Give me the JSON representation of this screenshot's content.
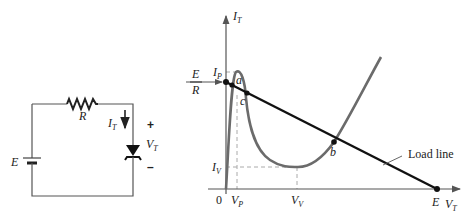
{
  "circuit": {
    "source_label": "E",
    "resistor_label": "R",
    "current_label": "I",
    "current_sub": "T",
    "voltage_label": "V",
    "voltage_sub": "T",
    "plus": "+",
    "minus": "–"
  },
  "graph": {
    "y_axis_label": "I",
    "y_axis_sub": "T",
    "x_axis_label": "V",
    "x_axis_sub": "T",
    "origin": "0",
    "ip_label": "I",
    "ip_sub": "P",
    "iv_label": "I",
    "iv_sub": "V",
    "vp_label": "V",
    "vp_sub": "P",
    "vv_label": "V",
    "vv_sub": "V",
    "e_over_r_num": "E",
    "e_over_r_den": "R",
    "e_label": "E",
    "point_a": "a",
    "point_b": "b",
    "point_c": "c",
    "load_line_label": "Load line"
  },
  "colors": {
    "curve": "#6b6b6b",
    "load_line": "#111111",
    "axis": "#555555",
    "dashed": "#aaaaaa",
    "wire": "#555555"
  }
}
